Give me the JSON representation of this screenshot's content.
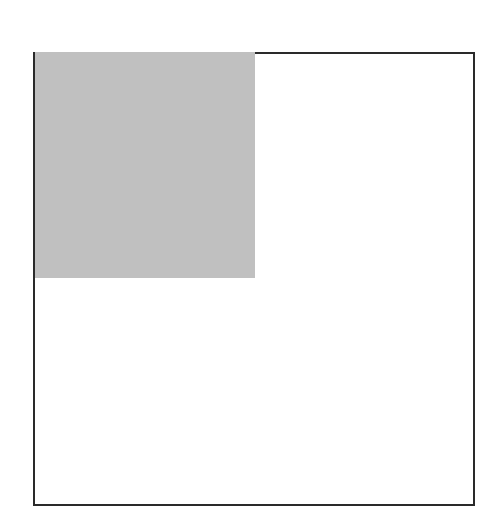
{
  "diagram": {
    "outer_square": {
      "stroke": "#2a2a2a",
      "fill": "#ffffff"
    },
    "inner_filled_square": {
      "fill": "#c0c0c0",
      "position": "top-left"
    }
  }
}
